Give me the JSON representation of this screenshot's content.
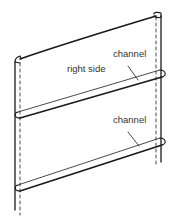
{
  "figure": {
    "type": "line-illustration",
    "labels": {
      "right_side": "right side",
      "channel_top": "channel",
      "channel_bottom": "channel"
    },
    "colors": {
      "ink": "#1a1a1a",
      "label": "#333333",
      "background": "#ffffff"
    }
  }
}
